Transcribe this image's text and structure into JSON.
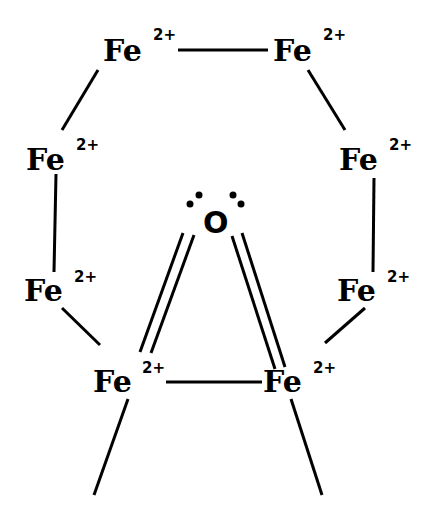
{
  "diagram": {
    "atoms": [
      {
        "id": "fe-top-left",
        "symbol": "Fe",
        "charge": "2+"
      },
      {
        "id": "fe-top-right",
        "symbol": "Fe",
        "charge": "2+"
      },
      {
        "id": "fe-mid-left",
        "symbol": "Fe",
        "charge": "2+"
      },
      {
        "id": "fe-mid-right",
        "symbol": "Fe",
        "charge": "2+"
      },
      {
        "id": "fe-low-left",
        "symbol": "Fe",
        "charge": "2+"
      },
      {
        "id": "fe-low-right",
        "symbol": "Fe",
        "charge": "2+"
      },
      {
        "id": "fe-bottom-left",
        "symbol": "Fe",
        "charge": "2+"
      },
      {
        "id": "fe-bottom-right",
        "symbol": "Fe",
        "charge": "2+"
      },
      {
        "id": "oxygen",
        "symbol": "O",
        "charge": "",
        "lone_pairs": 2
      }
    ],
    "bonds": [
      {
        "from": "fe-top-left",
        "to": "fe-top-right",
        "order": 1
      },
      {
        "from": "fe-top-left",
        "to": "fe-mid-left",
        "order": 1
      },
      {
        "from": "fe-top-right",
        "to": "fe-mid-right",
        "order": 1
      },
      {
        "from": "fe-mid-left",
        "to": "fe-low-left",
        "order": 1
      },
      {
        "from": "fe-mid-right",
        "to": "fe-low-right",
        "order": 1
      },
      {
        "from": "fe-low-left",
        "to": "fe-bottom-left",
        "order": 1
      },
      {
        "from": "fe-low-right",
        "to": "fe-bottom-right",
        "order": 1
      },
      {
        "from": "fe-bottom-left",
        "to": "fe-bottom-right",
        "order": 1
      },
      {
        "from": "oxygen",
        "to": "fe-bottom-left",
        "order": 2
      },
      {
        "from": "oxygen",
        "to": "fe-bottom-right",
        "order": 2
      },
      {
        "from": "fe-bottom-left",
        "to": "open-end",
        "order": 1
      },
      {
        "from": "fe-bottom-right",
        "to": "open-end",
        "order": 1
      }
    ],
    "labels": {
      "fe": "Fe",
      "charge": "2+",
      "oxygen": "O"
    }
  }
}
